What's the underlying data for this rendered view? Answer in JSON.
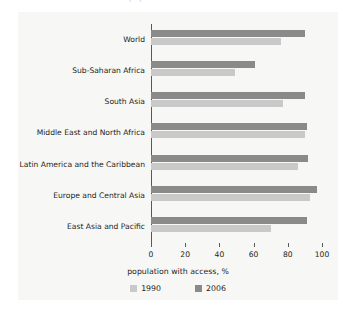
{
  "figure": {
    "clipped_title_fragment": "population with access",
    "background_color": "#f7f7f6"
  },
  "chart_data": {
    "type": "bar",
    "orientation": "horizontal",
    "title": "",
    "xlabel": "population with access, %",
    "ylabel": "",
    "xlim": [
      0,
      100
    ],
    "xticks": [
      0,
      20,
      40,
      60,
      80,
      100
    ],
    "xtick_labels": [
      "0",
      "20",
      "40",
      "60",
      "80",
      "100"
    ],
    "grid": false,
    "legend_position": "bottom",
    "categories": [
      "World",
      "Sub-Saharan Africa",
      "South Asia",
      "Middle East and North Africa",
      "Latin America and the Caribbean",
      "Europe and Central Asia",
      "East Asia and Pacific"
    ],
    "series": [
      {
        "name": "1990",
        "color": "#c9c9c9",
        "values": [
          76,
          49,
          77,
          90,
          86,
          93,
          70
        ]
      },
      {
        "name": "2006",
        "color": "#8a8a8a",
        "values": [
          90,
          61,
          90,
          91,
          92,
          97,
          91
        ]
      }
    ]
  }
}
